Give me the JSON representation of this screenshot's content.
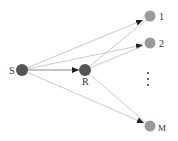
{
  "diagram": {
    "type": "relay network",
    "colors": {
      "source_relay": "#555555",
      "destination": "#9a9a9a",
      "edge": "#c4c4c4",
      "arrow": "#222222"
    },
    "nodes": [
      {
        "id": "S",
        "label": "S",
        "role": "source",
        "x": 22,
        "y": 70
      },
      {
        "id": "R",
        "label": "R",
        "role": "relay",
        "x": 85,
        "y": 70
      },
      {
        "id": "D1",
        "label": "1",
        "role": "destination",
        "x": 150,
        "y": 16
      },
      {
        "id": "D2",
        "label": "2",
        "role": "destination",
        "x": 150,
        "y": 43
      },
      {
        "id": "DM",
        "label": "M",
        "role": "destination",
        "x": 150,
        "y": 126
      }
    ],
    "edges": [
      {
        "from": "S",
        "to": "R"
      },
      {
        "from": "S",
        "to": "D1"
      },
      {
        "from": "S",
        "to": "D2"
      },
      {
        "from": "S",
        "to": "DM"
      },
      {
        "from": "R",
        "to": "D1"
      },
      {
        "from": "R",
        "to": "D2"
      },
      {
        "from": "R",
        "to": "DM"
      }
    ],
    "ellipsis": "⋮"
  }
}
